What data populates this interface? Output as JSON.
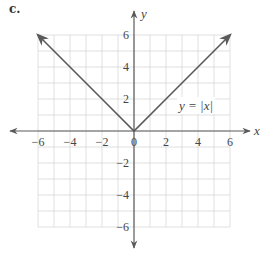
{
  "part_label": "c.",
  "chart_data": {
    "type": "line",
    "title": "",
    "function_label": "y = |x|",
    "xlabel": "x",
    "ylabel": "y",
    "xlim": [
      -6,
      6
    ],
    "ylim": [
      -6,
      6
    ],
    "grid": true,
    "grid_step": 1,
    "x_ticks": [
      -6,
      -4,
      -2,
      0,
      2,
      4,
      6
    ],
    "x_tick_labels": [
      "−6",
      "−4",
      "−2",
      "0",
      "2",
      "4",
      "6"
    ],
    "y_ticks": [
      -6,
      -4,
      -2,
      2,
      4,
      6
    ],
    "y_tick_labels": [
      "−6",
      "−4",
      "−2",
      "2",
      "4",
      "6"
    ],
    "series": [
      {
        "name": "y = |x|",
        "x": [
          -6,
          -4,
          -2,
          0,
          2,
          4,
          6
        ],
        "y": [
          6,
          4,
          2,
          0,
          2,
          4,
          6
        ]
      }
    ],
    "colors": {
      "line": "#5a5a5a",
      "axis": "#5a5a5a",
      "grid": "#d8d8d8",
      "text": "#444444"
    }
  }
}
